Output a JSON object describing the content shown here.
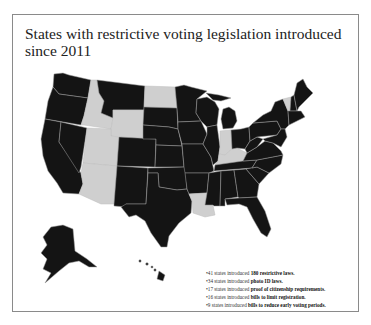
{
  "title": "States with restrictive voting legislation introduced since 2011",
  "colors": {
    "restrictive_state": "#141414",
    "other_state": "#cfcfcf",
    "state_border": "#9a9a9a",
    "frame_border": "#8a8a8a",
    "background": "#ffffff"
  },
  "map": {
    "legend_meaning": {
      "black": "restrictive voting legislation introduced",
      "gray": "no restrictive voting legislation introduced"
    },
    "gray_states": [
      "Idaho",
      "Wyoming",
      "Utah",
      "Arizona",
      "North Dakota",
      "Indiana",
      "Kentucky",
      "Louisiana",
      "Vermont"
    ],
    "insets": [
      "Alaska",
      "Hawaii"
    ]
  },
  "notes": [
    {
      "bullet": "•",
      "count": "41",
      "text_pre": "states introduced",
      "highlight": "180 restrictive laws."
    },
    {
      "bullet": "•",
      "count": "34",
      "text_pre": "states introduced",
      "highlight": "photo ID laws."
    },
    {
      "bullet": "•",
      "count": "17",
      "text_pre": "states introduced",
      "highlight": "proof of citizenship requirements."
    },
    {
      "bullet": "•",
      "count": "16",
      "text_pre": "states introduced",
      "highlight": "bills to limit registration."
    },
    {
      "bullet": "•",
      "count": "9",
      "text_pre": "states introduced",
      "highlight": "bills to reduce early voting periods."
    }
  ]
}
